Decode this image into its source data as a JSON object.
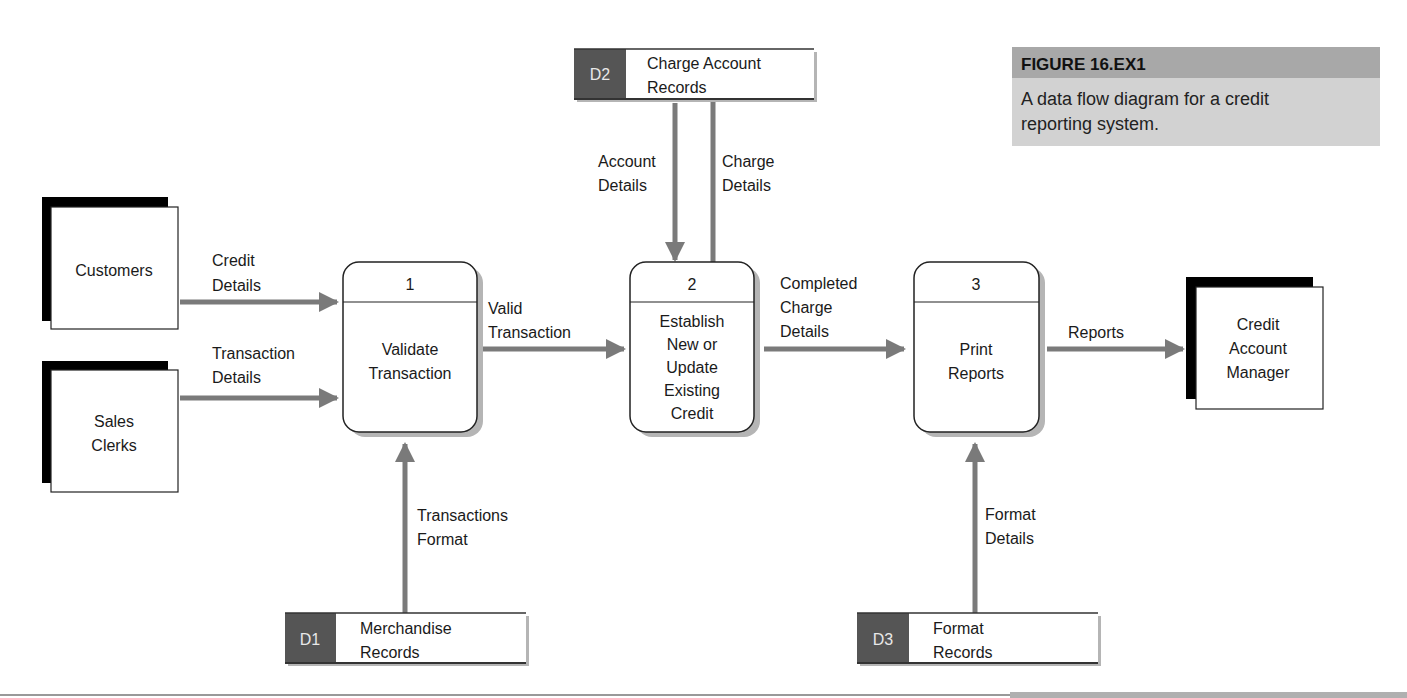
{
  "caption": {
    "figure_label": "FIGURE 16.EX1",
    "text_lines": [
      "A data flow diagram for a credit",
      "reporting system."
    ]
  },
  "colors": {
    "arrow": "#7a7a7a",
    "store_id_fill": "#555555",
    "caption_header": "#a8a8a8",
    "caption_body": "#d2d2d2",
    "shadow": "#b5b5b5",
    "entity_shadow": "#000000"
  },
  "entities": [
    {
      "id": "customers",
      "lines": [
        "Customers"
      ]
    },
    {
      "id": "sales-clerks",
      "lines": [
        "Sales",
        "Clerks"
      ]
    },
    {
      "id": "credit-account-manager",
      "lines": [
        "Credit",
        "Account",
        "Manager"
      ]
    }
  ],
  "processes": [
    {
      "id": "process-1",
      "number": "1",
      "lines": [
        "Validate",
        "Transaction"
      ]
    },
    {
      "id": "process-2",
      "number": "2",
      "lines": [
        "Establish",
        "New or",
        "Update",
        "Existing",
        "Credit"
      ]
    },
    {
      "id": "process-3",
      "number": "3",
      "lines": [
        "Print",
        "Reports"
      ]
    }
  ],
  "data_stores": [
    {
      "id": "D1",
      "label": "D1",
      "lines": [
        "Merchandise",
        "Records"
      ]
    },
    {
      "id": "D2",
      "label": "D2",
      "lines": [
        "Charge Account",
        "Records"
      ]
    },
    {
      "id": "D3",
      "label": "D3",
      "lines": [
        "Format",
        "Records"
      ]
    }
  ],
  "flows": [
    {
      "id": "credit-details",
      "from": "customers",
      "to": "process-1",
      "lines": [
        "Credit",
        "Details"
      ]
    },
    {
      "id": "transaction-details",
      "from": "sales-clerks",
      "to": "process-1",
      "lines": [
        "Transaction",
        "Details"
      ]
    },
    {
      "id": "transactions-format",
      "from": "D1",
      "to": "process-1",
      "lines": [
        "Transactions",
        "Format"
      ]
    },
    {
      "id": "valid-transaction",
      "from": "process-1",
      "to": "process-2",
      "lines": [
        "Valid",
        "Transaction"
      ]
    },
    {
      "id": "account-details",
      "from": "D2",
      "to": "process-2",
      "lines": [
        "Account",
        "Details"
      ]
    },
    {
      "id": "charge-details",
      "from": "process-2",
      "to": "D2",
      "lines": [
        "Charge",
        "Details"
      ]
    },
    {
      "id": "completed-charge-details",
      "from": "process-2",
      "to": "process-3",
      "lines": [
        "Completed",
        "Charge",
        "Details"
      ]
    },
    {
      "id": "format-details",
      "from": "D3",
      "to": "process-3",
      "lines": [
        "Format",
        "Details"
      ]
    },
    {
      "id": "reports",
      "from": "process-3",
      "to": "credit-account-manager",
      "lines": [
        "Reports"
      ]
    }
  ]
}
